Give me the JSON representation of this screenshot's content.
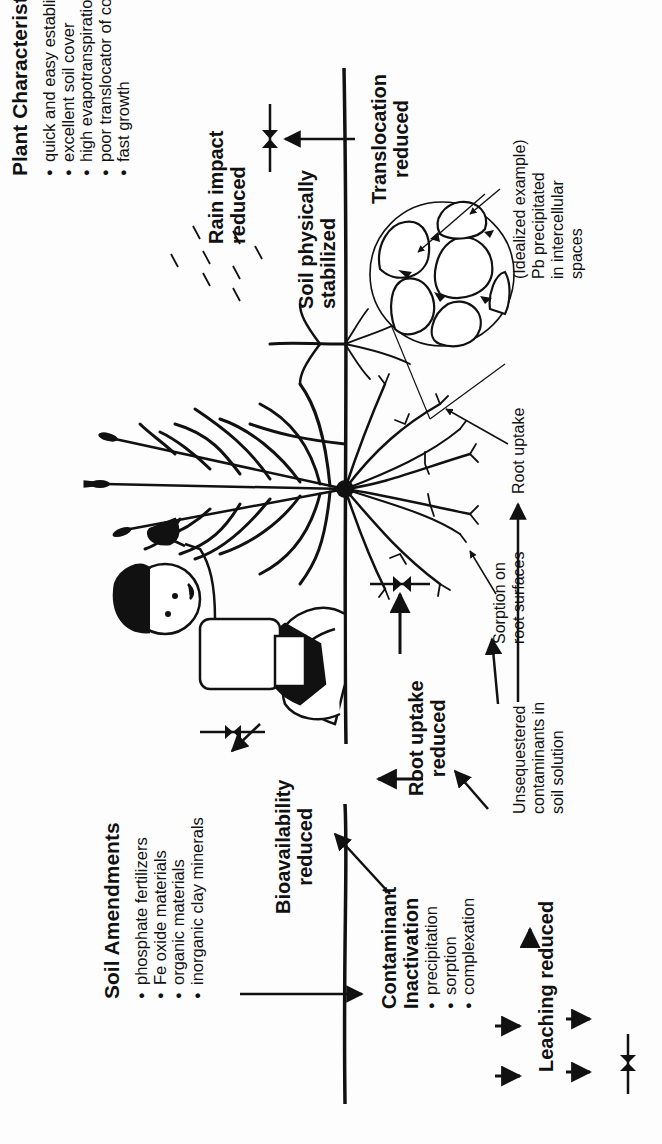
{
  "figure": {
    "orientation": "rotated 90 degrees counter-clockwise",
    "soil_amendments": {
      "title": "Soil Amendments",
      "items": [
        "phosphate fertilizers",
        "Fe oxide materials",
        "organic materials",
        "inorganic clay minerals"
      ]
    },
    "contaminant_inactivation": {
      "title_line1": "Contaminant",
      "title_line2": "Inactivation",
      "items": [
        "precipitation",
        "sorption",
        "complexation"
      ]
    },
    "leaching": {
      "label": "Leaching reduced"
    },
    "bioavailability": {
      "line1": "Bioavailability",
      "line2": "reduced"
    },
    "root_uptake_reduced": {
      "line1": "Root uptake",
      "line2": "reduced"
    },
    "unsequestered": {
      "line1": "Unsequestered",
      "line2": "contaminants in",
      "line3": "soil solution"
    },
    "sorption_roots": {
      "line1": "Sorption on",
      "line2": "root surfaces"
    },
    "root_uptake": {
      "label": "Root uptake"
    },
    "rain": {
      "line1": "Rain impact",
      "line2": "reduced"
    },
    "soil_stabilized": {
      "line1": "Soil physically",
      "line2": "stabilized"
    },
    "translocation": {
      "line1": "Translocation",
      "line2": "reduced"
    },
    "cell_example": {
      "line1": "(Idealized example)",
      "line2": "Pb precipitated",
      "line3": "in intercellular",
      "line4": "spaces"
    },
    "plant_characteristics": {
      "title": "Plant Characteristics",
      "items": [
        "quick and easy establishment",
        "excellent soil cover",
        "high evapotranspiration rate",
        "poor translocator of contaminants",
        "fast growth"
      ]
    },
    "colors": {
      "ink": "#111111",
      "background": "#fdfdfd"
    }
  }
}
